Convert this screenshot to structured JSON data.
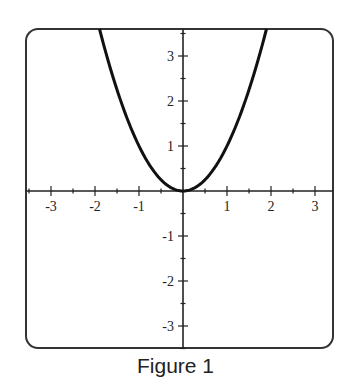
{
  "caption": "Figure 1",
  "chart_data": {
    "type": "line",
    "title": "",
    "caption": "Figure 1",
    "xlabel": "",
    "ylabel": "",
    "function": "y = x^2",
    "xlim": [
      -3.6,
      3.4
    ],
    "ylim": [
      -3.5,
      3.6
    ],
    "grid": false,
    "legend": null,
    "x_ticks": [
      -3,
      -2,
      -1,
      1,
      2,
      3
    ],
    "y_ticks": [
      3,
      2,
      1,
      -1,
      -2,
      -3
    ],
    "x_tick_labels": [
      "-3",
      "-2",
      "-1",
      "1",
      "2",
      "3"
    ],
    "y_tick_labels": [
      "3",
      "2",
      "1",
      "-1",
      "-2",
      "-3"
    ],
    "minor_tick_step": 0.5,
    "series": [
      {
        "name": "parabola",
        "x": [
          -1.9,
          -1.5,
          -1.0,
          -0.5,
          0.0,
          0.5,
          1.0,
          1.5,
          1.9
        ],
        "y": [
          3.61,
          2.25,
          1.0,
          0.25,
          0.0,
          0.25,
          1.0,
          2.25,
          3.61
        ]
      }
    ],
    "colors": {
      "curve": "#111111",
      "axes": "#222222",
      "frame": "#333333"
    }
  }
}
